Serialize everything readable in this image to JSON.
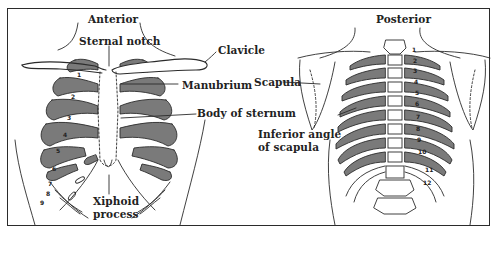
{
  "figure": {
    "views": [
      {
        "id": "anterior",
        "title": "Anterior"
      },
      {
        "id": "posterior",
        "title": "Posterior"
      }
    ],
    "anterior_labels": {
      "sternal_notch": "Sternal notch",
      "clavicle": "Clavicle",
      "manubrium": "Manubrium",
      "body_of_sternum": "Body of sternum",
      "xiphoid_line1": "Xiphoid",
      "xiphoid_line2": "process"
    },
    "posterior_labels": {
      "scapula": "Scapula",
      "inferior_angle_line1": "Inferior angle",
      "inferior_angle_line2": "of scapula"
    },
    "anterior_rib_numbers": [
      "1",
      "2",
      "3",
      "4",
      "5",
      "6",
      "7",
      "8",
      "9"
    ],
    "posterior_rib_numbers": [
      "1",
      "2",
      "3",
      "4",
      "5",
      "6",
      "7",
      "8",
      "9",
      "10",
      "11",
      "12"
    ],
    "colors": {
      "line": "#2b2b2b",
      "shade": "#7a7a7a",
      "background": "#ffffff"
    }
  }
}
